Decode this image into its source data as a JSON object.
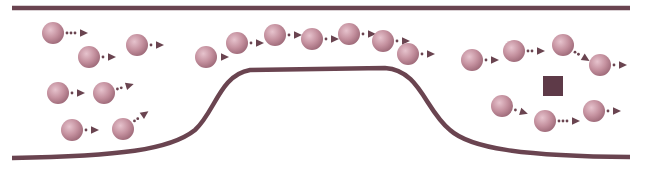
{
  "diagram": {
    "colors": {
      "wall": "#6a4450",
      "particle_light": "#e6c3cd",
      "particle_mid": "#c4909e",
      "particle_dark": "#9c6877",
      "arrow": "#6a4450",
      "square": "#5e3a48",
      "background": "#ffffff"
    },
    "walls": {
      "top": {
        "x1": 12,
        "x2": 630,
        "y": 8
      },
      "bottom_path": "M12,158 C120,156 170,150 195,130 C215,112 220,75 250,70 L385,68 C420,70 425,110 450,130 C470,148 520,156 630,157"
    },
    "particle_radius": 11,
    "particles": [
      {
        "group": "left",
        "cx": 53,
        "cy": 33,
        "dir": [
          1,
          0
        ],
        "dots": 3
      },
      {
        "group": "left",
        "cx": 89,
        "cy": 57,
        "dir": [
          1,
          0
        ],
        "dots": 1
      },
      {
        "group": "left",
        "cx": 137,
        "cy": 45,
        "dir": [
          1,
          0
        ],
        "dots": 1
      },
      {
        "group": "left",
        "cx": 58,
        "cy": 93,
        "dir": [
          1,
          0
        ],
        "dots": 1
      },
      {
        "group": "left",
        "cx": 104,
        "cy": 93,
        "dir": [
          1,
          -0.3
        ],
        "dots": 2
      },
      {
        "group": "left",
        "cx": 72,
        "cy": 130,
        "dir": [
          1,
          0
        ],
        "dots": 1
      },
      {
        "group": "left",
        "cx": 123,
        "cy": 129,
        "dir": [
          1,
          -0.7
        ],
        "dots": 2
      },
      {
        "group": "middle",
        "cx": 206,
        "cy": 57,
        "dir": [
          1,
          0
        ],
        "dots": 0
      },
      {
        "group": "middle",
        "cx": 237,
        "cy": 43,
        "dir": [
          1,
          0
        ],
        "dots": 1
      },
      {
        "group": "middle",
        "cx": 275,
        "cy": 35,
        "dir": [
          1,
          0
        ],
        "dots": 1
      },
      {
        "group": "middle",
        "cx": 312,
        "cy": 39,
        "dir": [
          1,
          0
        ],
        "dots": 1
      },
      {
        "group": "middle",
        "cx": 349,
        "cy": 34,
        "dir": [
          1,
          0
        ],
        "dots": 1
      },
      {
        "group": "middle",
        "cx": 383,
        "cy": 41,
        "dir": [
          1,
          0
        ],
        "dots": 1
      },
      {
        "group": "middle",
        "cx": 408,
        "cy": 54,
        "dir": [
          1,
          0
        ],
        "dots": 1
      },
      {
        "group": "right",
        "cx": 472,
        "cy": 60,
        "dir": [
          1,
          0
        ],
        "dots": 1
      },
      {
        "group": "right",
        "cx": 514,
        "cy": 51,
        "dir": [
          1,
          0
        ],
        "dots": 2
      },
      {
        "group": "right",
        "cx": 563,
        "cy": 45,
        "dir": [
          1,
          0.6
        ],
        "dots": 2
      },
      {
        "group": "right",
        "cx": 600,
        "cy": 65,
        "dir": [
          1,
          0
        ],
        "dots": 1
      },
      {
        "group": "right",
        "cx": 502,
        "cy": 106,
        "dir": [
          1,
          0.3
        ],
        "dots": 1
      },
      {
        "group": "right",
        "cx": 545,
        "cy": 121,
        "dir": [
          1,
          0
        ],
        "dots": 3
      },
      {
        "group": "right",
        "cx": 594,
        "cy": 111,
        "dir": [
          1,
          0
        ],
        "dots": 1
      }
    ],
    "obstacle_square": {
      "x": 543,
      "y": 76,
      "size": 20
    }
  }
}
